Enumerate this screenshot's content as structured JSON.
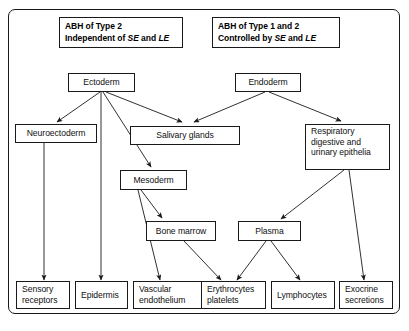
{
  "figure": {
    "headers": [
      {
        "id": "header-type2",
        "line1": "ABH of Type 2",
        "line2_pre": "Independent of ",
        "line2_em1": "SE",
        "line2_mid": " and ",
        "line2_em2": "LE"
      },
      {
        "id": "header-type1-2",
        "line1": "ABH of Type 1 and 2",
        "line2_pre": "Controlled by ",
        "line2_em1": "SE",
        "line2_mid": " and ",
        "line2_em2": "LE"
      }
    ],
    "nodes": [
      {
        "id": "ectoderm",
        "label": "Ectoderm"
      },
      {
        "id": "endoderm",
        "label": "Endoderm"
      },
      {
        "id": "neuroectoderm",
        "label": "Neuroectoderm"
      },
      {
        "id": "salivary-glands",
        "label": "Salivary glands"
      },
      {
        "id": "respiratory-epithelia",
        "line1": "Respiratory",
        "line2": "digestive and",
        "line3": "urinary epithelia"
      },
      {
        "id": "mesoderm",
        "label": "Mesoderm"
      },
      {
        "id": "bone-marrow",
        "label": "Bone marrow"
      },
      {
        "id": "plasma",
        "label": "Plasma"
      },
      {
        "id": "sensory-receptors",
        "line1": "Sensory",
        "line2": "receptors"
      },
      {
        "id": "epidermis",
        "label": "Epidermis"
      },
      {
        "id": "vascular-endothelium",
        "line1": "Vascular",
        "line2": "endothelium"
      },
      {
        "id": "erythrocytes-platelets",
        "line1": "Erythrocytes",
        "line2": "platelets"
      },
      {
        "id": "lymphocytes",
        "label": "Lymphocytes"
      },
      {
        "id": "exocrine-secretions",
        "line1": "Exocrine",
        "line2": "secretions"
      }
    ],
    "edges": [
      {
        "from": "ectoderm",
        "to": "neuroectoderm"
      },
      {
        "from": "ectoderm",
        "to": "epidermis"
      },
      {
        "from": "ectoderm",
        "to": "mesoderm"
      },
      {
        "from": "ectoderm",
        "to": "salivary-glands"
      },
      {
        "from": "endoderm",
        "to": "salivary-glands"
      },
      {
        "from": "endoderm",
        "to": "respiratory-epithelia"
      },
      {
        "from": "neuroectoderm",
        "to": "sensory-receptors"
      },
      {
        "from": "mesoderm",
        "to": "vascular-endothelium"
      },
      {
        "from": "mesoderm",
        "to": "bone-marrow"
      },
      {
        "from": "bone-marrow",
        "to": "erythrocytes-platelets"
      },
      {
        "from": "plasma",
        "to": "erythrocytes-platelets"
      },
      {
        "from": "plasma",
        "to": "lymphocytes"
      },
      {
        "from": "respiratory-epithelia",
        "to": "plasma"
      },
      {
        "from": "respiratory-epithelia",
        "to": "exocrine-secretions"
      }
    ],
    "colors": {
      "stroke": "#1a1a1a",
      "text": "#101010",
      "background": "#ffffff"
    }
  }
}
